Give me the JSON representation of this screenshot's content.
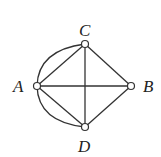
{
  "diagram": {
    "type": "graph",
    "nodes": [
      {
        "id": "A",
        "label": "A",
        "x": 37,
        "y": 86
      },
      {
        "id": "B",
        "label": "B",
        "x": 131,
        "y": 86
      },
      {
        "id": "C",
        "label": "C",
        "x": 85,
        "y": 44
      },
      {
        "id": "D",
        "label": "D",
        "x": 85,
        "y": 127
      }
    ],
    "edges": [
      {
        "from": "A",
        "to": "C",
        "style": "straight"
      },
      {
        "from": "A",
        "to": "C",
        "style": "arc"
      },
      {
        "from": "A",
        "to": "D",
        "style": "straight"
      },
      {
        "from": "A",
        "to": "D",
        "style": "arc"
      },
      {
        "from": "A",
        "to": "B",
        "style": "straight"
      },
      {
        "from": "C",
        "to": "B",
        "style": "straight"
      },
      {
        "from": "C",
        "to": "D",
        "style": "straight"
      },
      {
        "from": "D",
        "to": "B",
        "style": "straight"
      }
    ],
    "colors": {
      "stroke": "#333333",
      "background": "#ffffff"
    }
  }
}
